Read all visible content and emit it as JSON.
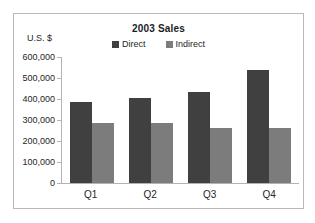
{
  "chart_data": {
    "type": "bar",
    "title": "2003 Sales",
    "categories": [
      "Q1",
      "Q2",
      "Q3",
      "Q4"
    ],
    "series": [
      {
        "name": "Direct",
        "color": "#404040",
        "values": [
          385000,
          405000,
          435000,
          540000
        ]
      },
      {
        "name": "Indirect",
        "color": "#7c7c7c",
        "values": [
          285000,
          285000,
          260000,
          260000
        ]
      }
    ],
    "xlabel": "",
    "ylabel": "U.S. $",
    "y_axis": {
      "label": "U.S. $",
      "min": 0,
      "max": 600000,
      "tick_step": 100000,
      "tick_labels": [
        "600,000",
        "500,000",
        "400,000",
        "300,000",
        "200,000",
        "100,000",
        "0"
      ]
    },
    "legend_position": "top",
    "grid": false,
    "colors": {
      "axis": "#b3b3b3",
      "panel_border": "#b9b9b9",
      "text": "#262626"
    }
  }
}
